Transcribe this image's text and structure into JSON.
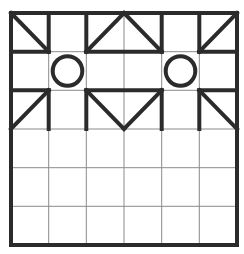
{
  "puzzle": {
    "grid": {
      "cols": 6,
      "rows": 6,
      "x_lines": [
        11,
        48.7,
        86.3,
        124,
        161.7,
        199.3,
        237
      ],
      "y_lines": [
        13,
        51.7,
        90.3,
        129,
        167.7,
        206.3,
        245
      ],
      "thin_color": "#8a8a8a",
      "thick_color": "#2b2b2b"
    },
    "thick_segments": [
      {
        "from": [
          0,
          0
        ],
        "to": [
          6,
          0
        ]
      },
      {
        "from": [
          0,
          1
        ],
        "to": [
          1,
          1
        ]
      },
      {
        "from": [
          2,
          1
        ],
        "to": [
          4,
          1
        ]
      },
      {
        "from": [
          5,
          1
        ],
        "to": [
          6,
          1
        ]
      },
      {
        "from": [
          0,
          2
        ],
        "to": [
          1,
          2
        ]
      },
      {
        "from": [
          2,
          2
        ],
        "to": [
          4,
          2
        ]
      },
      {
        "from": [
          5,
          2
        ],
        "to": [
          6,
          2
        ]
      },
      {
        "from": [
          0,
          6
        ],
        "to": [
          6,
          6
        ]
      },
      {
        "from": [
          0,
          0
        ],
        "to": [
          0,
          6
        ]
      },
      {
        "from": [
          6,
          0
        ],
        "to": [
          6,
          6
        ]
      },
      {
        "from": [
          1,
          0
        ],
        "to": [
          1,
          1
        ]
      },
      {
        "from": [
          2,
          0
        ],
        "to": [
          2,
          1
        ]
      },
      {
        "from": [
          4,
          0
        ],
        "to": [
          4,
          1
        ]
      },
      {
        "from": [
          5,
          0
        ],
        "to": [
          5,
          1
        ]
      },
      {
        "from": [
          1,
          2
        ],
        "to": [
          1,
          3
        ]
      },
      {
        "from": [
          2,
          2
        ],
        "to": [
          2,
          3
        ]
      },
      {
        "from": [
          4,
          2
        ],
        "to": [
          4,
          3
        ]
      },
      {
        "from": [
          5,
          2
        ],
        "to": [
          5,
          3
        ]
      },
      {
        "from": [
          0,
          0
        ],
        "to": [
          1,
          1
        ]
      },
      {
        "from": [
          2,
          1
        ],
        "to": [
          3,
          0
        ]
      },
      {
        "from": [
          3,
          0
        ],
        "to": [
          4,
          1
        ]
      },
      {
        "from": [
          5,
          1
        ],
        "to": [
          6,
          0
        ]
      },
      {
        "from": [
          0,
          3
        ],
        "to": [
          1,
          2
        ]
      },
      {
        "from": [
          2,
          2
        ],
        "to": [
          3,
          3
        ]
      },
      {
        "from": [
          3,
          3
        ],
        "to": [
          4,
          2
        ]
      },
      {
        "from": [
          5,
          2
        ],
        "to": [
          6,
          3
        ]
      }
    ],
    "circles": [
      {
        "cell": [
          1,
          1
        ],
        "label": "circle-cell-r2c2"
      },
      {
        "cell": [
          4,
          1
        ],
        "label": "circle-cell-r2c5"
      }
    ]
  }
}
